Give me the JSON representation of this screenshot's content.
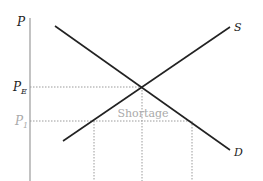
{
  "diagram": {
    "type": "supply-demand",
    "axis": {
      "y_label": "P"
    },
    "curves": [
      {
        "name": "supply",
        "label": "S"
      },
      {
        "name": "demand",
        "label": "D"
      }
    ],
    "price_levels": [
      {
        "name": "equilibrium-price",
        "label": "P",
        "subscript": "E"
      },
      {
        "name": "price-ceiling",
        "label": "P",
        "subscript": "1"
      }
    ],
    "annotation": "Shortage",
    "colors": {
      "curve": "#222222",
      "axis": "#9a9a9a",
      "dotted": "#9a9a9a",
      "muted_text": "#aaaaaa",
      "text": "#222222"
    }
  }
}
